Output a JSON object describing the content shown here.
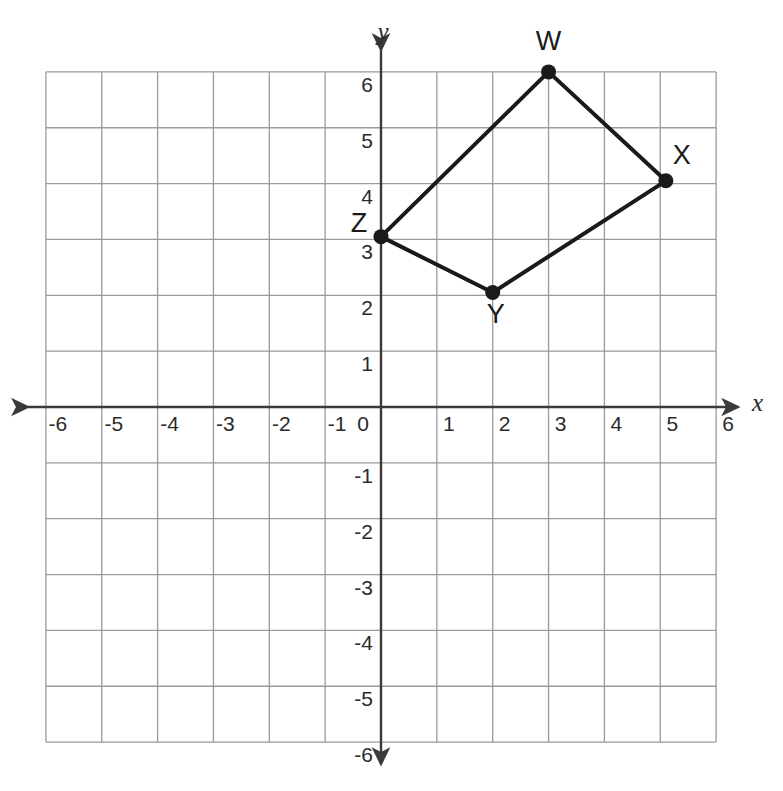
{
  "figure": {
    "background_color": "#ffffff",
    "grid_color": "#9a9a9a",
    "axis_color": "#3a3a3a",
    "shape_color": "#1a1a1a",
    "label_color": "#1a1a1a",
    "tick_color": "#2b2b2b"
  },
  "chart_data": {
    "type": "scatter",
    "title": "",
    "xlabel": "x",
    "ylabel": "y",
    "xlim": [
      -6,
      6
    ],
    "ylim": [
      -6,
      6
    ],
    "grid": true,
    "grid_step": 1,
    "legend": "none",
    "x_ticks": [
      "-6",
      "-5",
      "-4",
      "-3",
      "-2",
      "-1",
      "0",
      "1",
      "2",
      "3",
      "4",
      "5",
      "6"
    ],
    "x_tick_values": [
      -6,
      -5,
      -4,
      -3,
      -2,
      -1,
      0,
      1,
      2,
      3,
      4,
      5,
      6
    ],
    "y_ticks": [
      "6",
      "5",
      "4",
      "3",
      "2",
      "1",
      "0",
      "-1",
      "-2",
      "-3",
      "-4",
      "-5",
      "-6"
    ],
    "y_tick_values": [
      6,
      5,
      4,
      3,
      2,
      1,
      0,
      -1,
      -2,
      -3,
      -4,
      -5,
      -6
    ],
    "points": [
      {
        "label": "W",
        "x": 3,
        "y": 6,
        "label_dx": 0,
        "label_dy": -22
      },
      {
        "label": "X",
        "x": 5.1,
        "y": 4.05,
        "label_dx": 16,
        "label_dy": -17
      },
      {
        "label": "Y",
        "x": 2,
        "y": 2.05,
        "label_dx": 3,
        "label_dy": 30
      },
      {
        "label": "Z",
        "x": 0,
        "y": 3.05,
        "label_dx": -22,
        "label_dy": -5
      }
    ],
    "polygon": {
      "name": "WXYZ",
      "closed": true,
      "vertex_order": [
        "W",
        "X",
        "Y",
        "Z"
      ],
      "edges": [
        {
          "from": "W",
          "to": "X"
        },
        {
          "from": "X",
          "to": "Y"
        },
        {
          "from": "Y",
          "to": "Z"
        },
        {
          "from": "Z",
          "to": "W"
        }
      ]
    },
    "axes": {
      "x_axis_label": "x",
      "y_axis_label": "y",
      "x_arrows": "both",
      "y_arrows": "both"
    }
  },
  "tick_labels": {
    "x": [
      "-6",
      "-5",
      "-4",
      "-3",
      "-2",
      "-1",
      "0",
      "1",
      "2",
      "3",
      "4",
      "5",
      "6"
    ],
    "y_positive": [
      "6",
      "5",
      "4",
      "3",
      "2",
      "1"
    ],
    "y_negative": [
      "-1",
      "-2",
      "-3",
      "-4",
      "-5",
      "-6"
    ],
    "origin": "0"
  },
  "vertex_labels": {
    "w": "W",
    "x": "X",
    "y": "Y",
    "z": "Z"
  },
  "axis_labels": {
    "x": "x",
    "y": "y"
  }
}
